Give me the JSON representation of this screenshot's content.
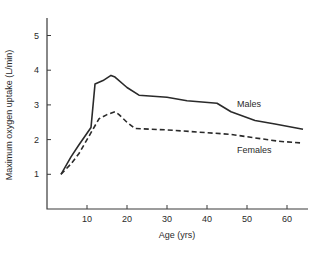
{
  "chart_data": {
    "type": "line",
    "title": "",
    "xlabel": "Age (yrs)",
    "ylabel": "Maximum oxygen uptake (L/min)",
    "xlim": [
      0,
      65
    ],
    "ylim": [
      0,
      5.8
    ],
    "xticks": [
      10,
      20,
      30,
      40,
      50,
      60
    ],
    "yticks": [
      1,
      2,
      3,
      4,
      5
    ],
    "grid": false,
    "legend_position": "inline labels right",
    "series": [
      {
        "name": "Males",
        "style": "solid",
        "label_pos": {
          "x": 237,
          "y": 107
        },
        "x": [
          3.5,
          6,
          8,
          11,
          12,
          14,
          16,
          17,
          20,
          23,
          30,
          35,
          42.5,
          46,
          52,
          57,
          64
        ],
        "values": [
          1.0,
          1.5,
          1.85,
          2.35,
          3.6,
          3.7,
          3.85,
          3.8,
          3.5,
          3.28,
          3.22,
          3.12,
          3.05,
          2.8,
          2.55,
          2.45,
          2.3
        ]
      },
      {
        "name": "Females",
        "style": "dashed",
        "label_pos": {
          "x": 237,
          "y": 153
        },
        "x": [
          3.5,
          6,
          8,
          11,
          13,
          15,
          17,
          18,
          20,
          22,
          30,
          40,
          46,
          52,
          58,
          64
        ],
        "values": [
          1.0,
          1.3,
          1.6,
          2.2,
          2.6,
          2.72,
          2.8,
          2.72,
          2.5,
          2.32,
          2.28,
          2.2,
          2.15,
          2.05,
          1.95,
          1.9
        ]
      }
    ]
  },
  "layout": {
    "plot": {
      "x0": 47,
      "y0": 209,
      "px_per_x": 4.0,
      "px_per_y": 34.7,
      "y_top": 18,
      "x_right": 308
    }
  }
}
